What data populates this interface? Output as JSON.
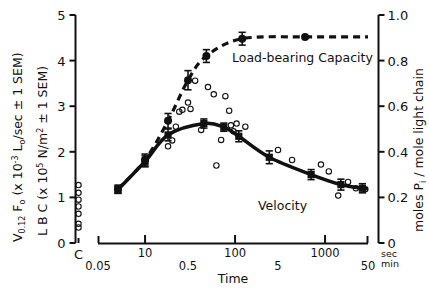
{
  "figure": {
    "background": "#ffffff",
    "ink": "#111111"
  },
  "axes": {
    "left": {
      "title_line1_main": "V",
      "title_line1_sub": "0.12",
      "title_line1_main2": " F",
      "title_line1_sub2": "o",
      "title_line1_rest": "  (x 10",
      "title_line1_sup": "-3",
      "title_line1_rest2": " L",
      "title_line1_sub3": "o",
      "title_line1_rest3": "/sec ± 1 SEM)",
      "title_line2_main": "L B C  (x 10",
      "title_line2_sup": "5",
      "title_line2_rest": " N/m",
      "title_line2_sup2": "2",
      "title_line2_rest2": " ± 1 SEM)",
      "ticks": [
        "0",
        "1",
        "2",
        "3",
        "4",
        "5"
      ],
      "min": 0,
      "max": 5
    },
    "right": {
      "title": "moles P",
      "title_sub": "i",
      "title_rest": " / mole light chain",
      "ticks": [
        "0",
        "0.2",
        "0.4",
        "0.6",
        "0.8",
        "1.0"
      ],
      "min": 0,
      "max": 1.0
    },
    "x": {
      "title": "Time",
      "unit_top": "sec",
      "unit_bottom": "min",
      "control_label": "C",
      "ticks_sec": [
        "10",
        "100",
        "1000"
      ],
      "ticks_min": [
        "0.05",
        "0.5",
        "5",
        "50"
      ],
      "log_min_sec": 3,
      "log_max_sec": 3000
    }
  },
  "series_labels": {
    "lbc": "Load-bearing Capacity",
    "velocity": "Velocity"
  },
  "chart_data": {
    "type": "line",
    "title": "",
    "xlabel": "Time",
    "ylabel": "V0.12 Fo (x 10-3 Lo/sec ± 1 SEM) / L B C (x 10^5 N/m^2 ± 1 SEM)",
    "y2label": "moles Pi / mole light chain",
    "xscale": "log",
    "xlim_sec": [
      3,
      3000
    ],
    "ylim": [
      0,
      5
    ],
    "y2lim": [
      0,
      1.0
    ],
    "grid": false,
    "legend": "inline-annotations",
    "xticks_sec": [
      10,
      100,
      1000
    ],
    "xticks_min": [
      0.05,
      0.5,
      5,
      50
    ],
    "yticks": [
      0,
      1,
      2,
      3,
      4,
      5
    ],
    "y2ticks": [
      0,
      0.2,
      0.4,
      0.6,
      0.8,
      1.0
    ],
    "series": [
      {
        "name": "Load-bearing Capacity",
        "marker": "filled-circle",
        "line": "dashed",
        "x_sec": [
          5.0,
          10.0,
          18.0,
          30.0,
          48.0,
          120.0,
          600.0
        ],
        "y": [
          1.18,
          1.82,
          2.68,
          3.57,
          4.1,
          4.48,
          4.52
        ],
        "yerr": [
          0.09,
          0.13,
          0.16,
          0.21,
          0.14,
          0.14,
          0.0
        ]
      },
      {
        "name": "Velocity",
        "marker": "filled-square",
        "line": "solid-thick",
        "x_sec": [
          5.0,
          10.0,
          18.0,
          45.0,
          75.0,
          110.0,
          240.0,
          700.0,
          1500.0,
          2600.0
        ],
        "y": [
          1.17,
          1.79,
          2.37,
          2.62,
          2.54,
          2.34,
          1.88,
          1.5,
          1.28,
          1.2
        ],
        "yerr": [
          0.08,
          0.12,
          0.13,
          0.1,
          0.09,
          0.12,
          0.14,
          0.11,
          0.12,
          0.1
        ]
      },
      {
        "name": "Individual measurements",
        "marker": "open-circle",
        "line": "none",
        "x_sec": [
          18.0,
          20.0,
          22.0,
          24.0,
          26.0,
          30.0,
          32.0,
          36.0,
          42.0,
          50.0,
          58.0,
          62.0,
          70.0,
          78.0,
          86.0,
          90.0,
          96.0,
          104.0,
          130.0,
          300.0,
          430.0,
          900.0,
          1100.0,
          1400.0,
          1800.0,
          2200.0,
          2800.0
        ],
        "y": [
          2.12,
          2.25,
          2.55,
          2.88,
          2.92,
          3.08,
          2.94,
          3.56,
          2.48,
          3.42,
          3.26,
          1.7,
          2.26,
          3.22,
          2.9,
          2.58,
          2.45,
          2.62,
          2.55,
          2.04,
          1.82,
          1.72,
          1.57,
          1.04,
          1.34,
          1.2,
          1.18
        ]
      },
      {
        "name": "Control",
        "marker": "open-circle-column",
        "line": "none",
        "x_sec": null,
        "x_position": "C",
        "y": [
          1.27,
          1.1,
          0.95,
          0.8,
          0.64,
          0.42,
          0.34
        ]
      }
    ]
  }
}
